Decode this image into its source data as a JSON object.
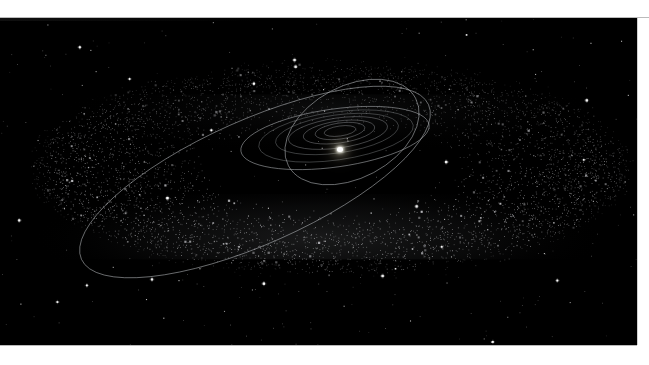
{
  "image": {
    "kind": "astronomical-illustration",
    "subject": "Kuiper Belt and outer solar system orbits",
    "background_color": "#000000",
    "paper_color": "#ffffff",
    "plate": {
      "x": 0,
      "y": 18,
      "width": 637,
      "height": 327
    }
  },
  "scene": {
    "sun": {
      "name": "Sun",
      "cx": 340,
      "cy": 130,
      "color": "#ffffff",
      "glow_color": "#fff0be",
      "radius_px": 3
    },
    "belt": {
      "name": "Kuiper Belt",
      "center_x": 330,
      "center_y": 168,
      "outer_rx": 300,
      "outer_ry": 104,
      "inner_rx": 128,
      "inner_ry": 44,
      "thickness_px": 46,
      "particle_color": "#d6d9dc",
      "particle_count": 5200,
      "front_edge_brighter": true
    },
    "orbits": [
      {
        "name": "inner-planet-orbit-1",
        "cx": 340,
        "cy": 131,
        "rx": 16,
        "ry": 5,
        "rotate": -8,
        "style": "inner"
      },
      {
        "name": "inner-planet-orbit-2",
        "cx": 340,
        "cy": 131,
        "rx": 25,
        "ry": 8,
        "rotate": -8,
        "style": "inner"
      },
      {
        "name": "inner-planet-orbit-3",
        "cx": 339,
        "cy": 132,
        "rx": 36,
        "ry": 11,
        "rotate": -8,
        "style": "inner"
      },
      {
        "name": "jupiter-orbit",
        "cx": 338,
        "cy": 133,
        "rx": 50,
        "ry": 15,
        "rotate": -8,
        "style": "inner"
      },
      {
        "name": "saturn-orbit",
        "cx": 337,
        "cy": 134,
        "rx": 62,
        "ry": 19,
        "rotate": -8,
        "style": "faint"
      },
      {
        "name": "uranus-orbit",
        "cx": 336,
        "cy": 136,
        "rx": 78,
        "ry": 24,
        "rotate": -8,
        "style": "faint"
      },
      {
        "name": "neptune-orbit",
        "cx": 335,
        "cy": 138,
        "rx": 95,
        "ry": 29,
        "rotate": -8,
        "style": "normal"
      },
      {
        "name": "pluto-orbit-inclined",
        "cx": 352,
        "cy": 132,
        "rx": 72,
        "ry": 46,
        "rotate": -28,
        "style": "normal"
      },
      {
        "name": "sedna-like-eccentric-orbit",
        "cx": 255,
        "cy": 182,
        "rx": 190,
        "ry": 62,
        "rotate": -24,
        "style": "normal"
      }
    ],
    "field_stars": {
      "color": "#ffffff",
      "count": 340,
      "description": "sparse background stars scattered over the black sky"
    }
  },
  "labels": {
    "has_text": false,
    "note": "No visible captions, axes, legends or UI chrome in this image."
  }
}
